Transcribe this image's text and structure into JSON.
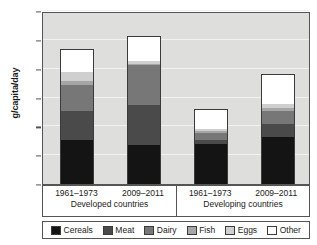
{
  "chart_data": {
    "type": "bar",
    "stacked": true,
    "title": "",
    "xlabel": "",
    "ylabel": "g/capita/day",
    "ylim": [
      0,
      120
    ],
    "yticks": [
      0,
      20,
      40,
      60,
      80,
      100,
      120
    ],
    "grid": true,
    "legend_position": "bottom",
    "categories": [
      "1961–1973",
      "2009–2011",
      "1961–1973",
      "2009–2011"
    ],
    "category_groups": [
      {
        "label": "Developed countries",
        "periods": [
          "1961–1973",
          "2009–2011"
        ]
      },
      {
        "label": "Developing countries",
        "periods": [
          "1961–1973",
          "2009–2011"
        ]
      }
    ],
    "series": [
      {
        "name": "Cereals",
        "color": "#141414",
        "values": [
          31.0,
          27.0,
          28.0,
          33.0
        ]
      },
      {
        "name": "Meat",
        "color": "#4a4a4a",
        "values": [
          20.0,
          28.0,
          3.0,
          9.0
        ]
      },
      {
        "name": "Dairy",
        "color": "#777777",
        "values": [
          18.0,
          28.0,
          5.0,
          9.0
        ]
      },
      {
        "name": "Fish",
        "color": "#a6a6a6",
        "values": [
          3.0,
          1.0,
          1.5,
          2.5
        ]
      },
      {
        "name": "Eggs",
        "color": "#cfcfcf",
        "values": [
          6.0,
          2.0,
          1.5,
          2.5
        ]
      },
      {
        "name": "Other",
        "color": "#ffffff",
        "values": [
          15.5,
          16.5,
          13.0,
          20.5
        ]
      }
    ],
    "totals": [
      93.5,
      102.5,
      52.0,
      76.5
    ]
  },
  "colors": {
    "plot_background": "#dededd",
    "gridline": "#f2f2f1",
    "axis": "#555555",
    "bar_outline": "#3b3b3b",
    "text": "#1a1a1a"
  }
}
